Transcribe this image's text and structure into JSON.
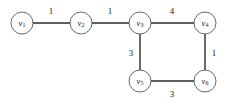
{
  "figure": {
    "type": "weighted-undirected-graph",
    "background_color": "#ffffff",
    "node_fill": "#ffffff",
    "node_stroke": "#575757",
    "edge_color": "#2b2b2b",
    "text_color": "#1a1a1a"
  },
  "nodes": [
    {
      "id": "v1",
      "base": "v",
      "subscript": "1",
      "cx": 22,
      "cy": 23,
      "r": 11
    },
    {
      "id": "v2",
      "base": "v",
      "subscript": "2",
      "cx": 81,
      "cy": 23,
      "r": 11
    },
    {
      "id": "v3",
      "base": "v",
      "subscript": "3",
      "cx": 140,
      "cy": 23,
      "r": 11
    },
    {
      "id": "v4",
      "base": "v",
      "subscript": "4",
      "cx": 205,
      "cy": 23,
      "r": 11
    },
    {
      "id": "v5",
      "base": "v",
      "subscript": "5",
      "cx": 140,
      "cy": 81,
      "r": 11
    },
    {
      "id": "v6",
      "base": "v",
      "subscript": "6",
      "cx": 205,
      "cy": 81,
      "r": 11
    }
  ],
  "edges": [
    {
      "id": "e-v1-v2",
      "source": "v1",
      "target": "v2",
      "weight": "1",
      "x1": 33,
      "y1": 23,
      "x2": 70,
      "y2": 23,
      "label_x": 51,
      "label_y": 11
    },
    {
      "id": "e-v2-v3",
      "source": "v2",
      "target": "v3",
      "weight": "1",
      "x1": 92,
      "y1": 23,
      "x2": 129,
      "y2": 23,
      "label_x": 110,
      "label_y": 11
    },
    {
      "id": "e-v3-v4",
      "source": "v3",
      "target": "v4",
      "weight": "4",
      "x1": 151,
      "y1": 23,
      "x2": 194,
      "y2": 23,
      "label_x": 172,
      "label_y": 11
    },
    {
      "id": "e-v3-v5",
      "source": "v3",
      "target": "v5",
      "weight": "3",
      "x1": 140,
      "y1": 34,
      "x2": 140,
      "y2": 70,
      "label_x": 131,
      "label_y": 53
    },
    {
      "id": "e-v4-v6",
      "source": "v4",
      "target": "v6",
      "weight": "1",
      "x1": 205,
      "y1": 34,
      "x2": 205,
      "y2": 70,
      "label_x": 214,
      "label_y": 53
    },
    {
      "id": "e-v5-v6",
      "source": "v5",
      "target": "v6",
      "weight": "3",
      "x1": 151,
      "y1": 81,
      "x2": 194,
      "y2": 81,
      "label_x": 172,
      "label_y": 94
    }
  ]
}
